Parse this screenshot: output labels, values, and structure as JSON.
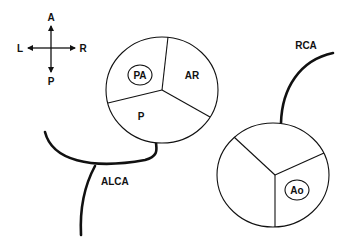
{
  "compass": {
    "top": "A",
    "bottom": "P",
    "left": "L",
    "right": "R"
  },
  "pulmonary_valve": {
    "cusps": [
      "PA",
      "AR",
      "P"
    ],
    "circled_label": "PA"
  },
  "aortic_valve": {
    "circled_label": "Ao"
  },
  "vessels": {
    "left": "ALCA",
    "right": "RCA"
  },
  "colors": {
    "stroke": "#111111",
    "background": "#ffffff"
  }
}
